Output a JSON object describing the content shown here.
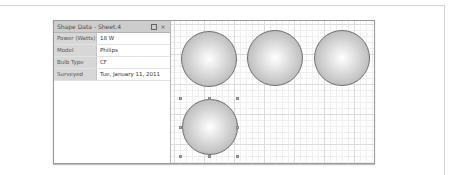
{
  "shape_data_panel": {
    "title": "Shape Data - Sheet.4",
    "restore_icon": "restore-window-icon",
    "close_label": "×",
    "rows": [
      {
        "label": "Power (Watts)",
        "value": "18 W"
      },
      {
        "label": "Model",
        "value": "Philips"
      },
      {
        "label": "Bulb Type",
        "value": "CF"
      },
      {
        "label": "Surveyed",
        "value": "Tue, January 11, 2011"
      }
    ]
  },
  "canvas": {
    "shapes": [
      {
        "name": "bulb-1",
        "selected": false
      },
      {
        "name": "bulb-2",
        "selected": false
      },
      {
        "name": "bulb-3",
        "selected": false
      },
      {
        "name": "bulb-4",
        "selected": true
      }
    ]
  }
}
